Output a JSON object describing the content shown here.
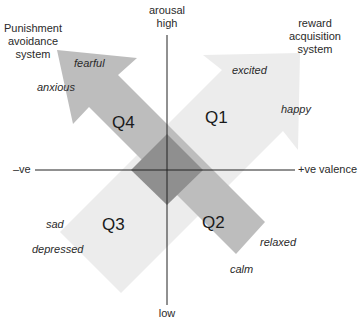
{
  "axes": {
    "vertical": {
      "title": "arousal",
      "top_label": "high",
      "bottom_label": "low"
    },
    "horizontal": {
      "left_label": "–ve",
      "right_label": "+ve valence"
    }
  },
  "systems": {
    "punishment": {
      "line1": "Punishment",
      "line2": "avoidance",
      "line3": "system"
    },
    "reward": {
      "line1": "reward",
      "line2": "acquisition",
      "line3": "system"
    }
  },
  "quadrants": [
    {
      "id": "Q1",
      "label": "Q1",
      "emotions": [
        "excited",
        "happy"
      ]
    },
    {
      "id": "Q2",
      "label": "Q2",
      "emotions": [
        "relaxed",
        "calm"
      ]
    },
    {
      "id": "Q3",
      "label": "Q3",
      "emotions": [
        "sad",
        "depressed"
      ]
    },
    {
      "id": "Q4",
      "label": "Q4",
      "emotions": [
        "fearful",
        "anxious"
      ]
    }
  ],
  "colors": {
    "punishment_arrow": "#bdbdbd",
    "reward_arrow": "#ececec",
    "overlap": "#8f8f8f",
    "axis": "#222222"
  }
}
